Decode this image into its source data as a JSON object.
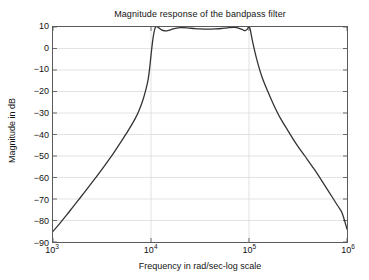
{
  "chart_data": {
    "type": "line",
    "title": "Magnitude response of the bandpass filter",
    "xlabel": "Frequency in rad/sec-log scale",
    "ylabel": "Magnitude in dB",
    "xscale": "log",
    "xlim": [
      1000,
      1000000
    ],
    "ylim": [
      -90,
      10
    ],
    "grid": true,
    "legend": null,
    "xticks": [
      {
        "value": 1000,
        "label": "10",
        "exponent": "3"
      },
      {
        "value": 10000,
        "label": "10",
        "exponent": "4"
      },
      {
        "value": 100000,
        "label": "10",
        "exponent": "5"
      },
      {
        "value": 1000000,
        "label": "10",
        "exponent": "6"
      }
    ],
    "yticks": [
      10,
      0,
      -10,
      -20,
      -30,
      -40,
      -50,
      -60,
      -70,
      -80,
      -90
    ],
    "ytick_labels": [
      "10",
      "0",
      "−10",
      "−20",
      "−30",
      "−40",
      "−50",
      "−60",
      "−70",
      "−80",
      "−90"
    ],
    "line_color": "#333333",
    "line_width": 1.3,
    "series": [
      {
        "name": "Bandpass magnitude response",
        "x": [
          1000,
          1175,
          1380,
          1622,
          1905,
          2239,
          2630,
          3090,
          3631,
          4266,
          5012,
          5888,
          6918,
          7586,
          8318,
          8913,
          9333,
          9661,
          10000,
          10471,
          11000,
          11482,
          12000,
          13183,
          14454,
          15849,
          17783,
          20000,
          23442,
          27542,
          31623,
          38019,
          45000,
          52481,
          60256,
          70795,
          79433,
          87096,
          91201,
          95499,
          97724,
          100000,
          102329,
          104713,
          109648,
          120226,
          134896,
          154882,
          177828,
          208930,
          251189,
          301995,
          371535,
          457088,
          549541,
          660693,
          794328,
          891251,
          1000000
        ],
        "y": [
          -85.0,
          -81.3,
          -77.4,
          -73.3,
          -69.3,
          -65.2,
          -61.0,
          -56.8,
          -52.4,
          -47.8,
          -43.0,
          -38.0,
          -32.5,
          -28.6,
          -23.6,
          -18.7,
          -14.6,
          -9.6,
          -3.2,
          4.6,
          9.5,
          10.1,
          9.6,
          8.4,
          8.2,
          8.7,
          9.4,
          9.7,
          9.6,
          9.3,
          9.1,
          9.0,
          9.1,
          9.3,
          9.6,
          9.8,
          9.4,
          8.6,
          8.3,
          8.9,
          9.6,
          10.1,
          9.3,
          7.2,
          2.5,
          -5.2,
          -12.9,
          -19.8,
          -26.0,
          -32.4,
          -38.4,
          -44.2,
          -50.0,
          -55.8,
          -61.3,
          -67.0,
          -72.8,
          -76.5,
          -84.0
        ]
      }
    ]
  }
}
